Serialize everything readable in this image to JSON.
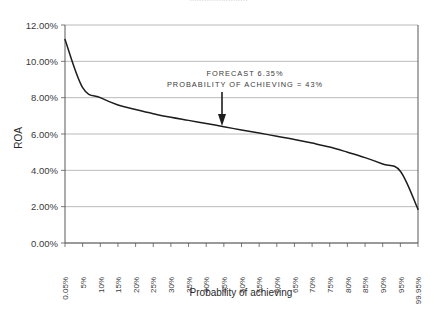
{
  "figure": {
    "clipped_top_title": "........................",
    "background_color": "#ffffff",
    "line_color": "#1d1d1d",
    "grid_color": "#a8a8ab",
    "axis_color": "#58585a"
  },
  "annotation": {
    "line1": "FORECAST 6.35%",
    "line2": "PROBABILITY OF ACHIEVING = 43%",
    "pointer_x_category": "45%",
    "pointer_value": "6.35%"
  },
  "chart_data": {
    "type": "line",
    "title": "",
    "xlabel": "Probability of achieving",
    "ylabel": "ROA",
    "grid": true,
    "legend": false,
    "ylim": [
      0,
      12
    ],
    "ytick_labels": [
      "0.00%",
      "2.00%",
      "4.00%",
      "6.00%",
      "8.00%",
      "10.00%",
      "12.00%"
    ],
    "ytick_values": [
      0,
      2,
      4,
      6,
      8,
      10,
      12
    ],
    "categories": [
      "0.05%",
      "5%",
      "10%",
      "15%",
      "20%",
      "25%",
      "30%",
      "35%",
      "40%",
      "45%",
      "50%",
      "55%",
      "60%",
      "65%",
      "70%",
      "75%",
      "80%",
      "85%",
      "90%",
      "95%",
      "99.95%"
    ],
    "values": [
      11.2,
      8.55,
      8.0,
      7.6,
      7.35,
      7.12,
      6.92,
      6.75,
      6.58,
      6.4,
      6.22,
      6.05,
      5.88,
      5.7,
      5.5,
      5.28,
      5.0,
      4.7,
      4.35,
      3.95,
      1.85
    ],
    "series": [
      {
        "name": "ROA",
        "values": [
          11.2,
          8.55,
          8.0,
          7.6,
          7.35,
          7.12,
          6.92,
          6.75,
          6.58,
          6.4,
          6.22,
          6.05,
          5.88,
          5.7,
          5.5,
          5.28,
          5.0,
          4.7,
          4.35,
          3.95,
          1.85
        ]
      }
    ]
  }
}
